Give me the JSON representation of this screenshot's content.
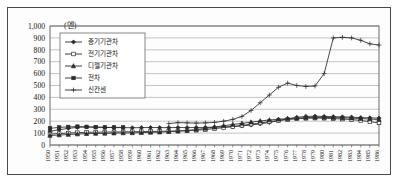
{
  "figure": {
    "unit_label": "(엔)",
    "frame": true
  },
  "chart_data": {
    "type": "line",
    "title": "",
    "subtitle": "",
    "xlabel": "",
    "ylabel": "",
    "unit": "엔",
    "ylim": [
      0,
      1000
    ],
    "ytick_step": 100,
    "grid": true,
    "legend_position": "upper-left-inside",
    "ytick_labels": [
      "0",
      "100",
      "200",
      "300",
      "400",
      "500",
      "600",
      "700",
      "800",
      "900",
      "1,000"
    ],
    "categories": [
      "1950",
      "1951",
      "1952",
      "1953",
      "1954",
      "1955",
      "1956",
      "1957",
      "1958",
      "1959",
      "1960",
      "1961",
      "1962",
      "1963",
      "1964",
      "1965",
      "1966",
      "1967",
      "1968",
      "1969",
      "1970",
      "1971",
      "1972",
      "1973",
      "1974",
      "1975",
      "1976",
      "1977",
      "1978",
      "1979",
      "1980",
      "1981",
      "1982",
      "1983",
      "1984",
      "1985",
      "1986"
    ],
    "x": [
      1950,
      1951,
      1952,
      1953,
      1954,
      1955,
      1956,
      1957,
      1958,
      1959,
      1960,
      1961,
      1962,
      1963,
      1964,
      1965,
      1966,
      1967,
      1968,
      1969,
      1970,
      1971,
      1972,
      1973,
      1974,
      1975,
      1976,
      1977,
      1978,
      1979,
      1980,
      1981,
      1982,
      1983,
      1984,
      1985,
      1986
    ],
    "series": [
      {
        "name": "증기기관차",
        "marker": "diamond-filled",
        "values": [
          115,
          128,
          140,
          148,
          152,
          150,
          148,
          146,
          146,
          145,
          146,
          147,
          146,
          146,
          147,
          146,
          147,
          148,
          150,
          152,
          155,
          160,
          168,
          178,
          190,
          205,
          220,
          232,
          240,
          242,
          240,
          238,
          236,
          234,
          230,
          228,
          226
        ]
      },
      {
        "name": "전기기관차",
        "marker": "square-open",
        "values": [
          92,
          96,
          100,
          104,
          106,
          108,
          108,
          110,
          110,
          112,
          112,
          114,
          115,
          116,
          118,
          120,
          124,
          130,
          138,
          146,
          155,
          165,
          175,
          185,
          196,
          206,
          214,
          220,
          224,
          226,
          225,
          222,
          218,
          214,
          206,
          196,
          186
        ]
      },
      {
        "name": "디젤기관차",
        "marker": "triangle-filled",
        "values": [
          80,
          84,
          88,
          92,
          95,
          97,
          98,
          100,
          101,
          102,
          104,
          106,
          108,
          112,
          116,
          122,
          130,
          140,
          150,
          162,
          172,
          182,
          192,
          202,
          210,
          216,
          222,
          226,
          230,
          232,
          232,
          230,
          228,
          226,
          222,
          218,
          214
        ]
      },
      {
        "name": "전차",
        "marker": "square-filled",
        "values": [
          140,
          148,
          152,
          155,
          152,
          150,
          148,
          148,
          148,
          null,
          null,
          null,
          null,
          null,
          null,
          null,
          null,
          null,
          null,
          null,
          null,
          null,
          null,
          null,
          null,
          null,
          null,
          null,
          null,
          null,
          null,
          null,
          null,
          null,
          null,
          null,
          null
        ]
      },
      {
        "name": "신칸센",
        "marker": "plus",
        "values": [
          null,
          null,
          null,
          null,
          null,
          null,
          null,
          null,
          null,
          null,
          null,
          null,
          null,
          180,
          188,
          186,
          184,
          186,
          190,
          200,
          215,
          240,
          290,
          355,
          420,
          485,
          520,
          500,
          492,
          496,
          600,
          900,
          905,
          900,
          880,
          850,
          840
        ]
      }
    ],
    "annotations": []
  },
  "legend": {
    "entries": [
      {
        "label": "증기기관차",
        "marker": "diamond-filled"
      },
      {
        "label": "전기기관차",
        "marker": "square-open"
      },
      {
        "label": "디젤기관차",
        "marker": "triangle-filled"
      },
      {
        "label": "전차",
        "marker": "square-filled"
      },
      {
        "label": "신칸센",
        "marker": "plus"
      }
    ]
  }
}
